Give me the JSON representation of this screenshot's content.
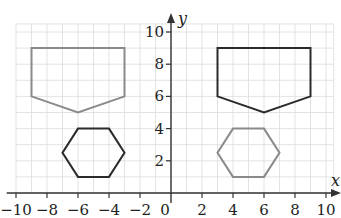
{
  "diagram": {
    "type": "coordinate-grid-transformation",
    "axes": {
      "x_label": "x",
      "y_label": "y",
      "x_range": [
        -10,
        10
      ],
      "y_range": [
        0,
        10
      ],
      "x_ticks": [
        -10,
        -8,
        -6,
        -4,
        -2,
        0,
        2,
        4,
        6,
        8,
        10
      ],
      "x_tick_labels": [
        "−10",
        "−8",
        "−6",
        "−4",
        "−2",
        "0",
        "2",
        "4",
        "6",
        "8",
        "10"
      ],
      "y_ticks": [
        2,
        4,
        6,
        8,
        10
      ],
      "y_tick_labels": [
        "2",
        "4",
        "6",
        "8",
        "10"
      ],
      "grid_step": 1
    },
    "shapes": [
      {
        "name": "pentagon-left",
        "kind": "pentagon",
        "stroke": "#8a8a8a",
        "points": [
          [
            -9,
            9
          ],
          [
            -3,
            9
          ],
          [
            -3,
            6
          ],
          [
            -6,
            5
          ],
          [
            -9,
            6
          ]
        ]
      },
      {
        "name": "pentagon-right",
        "kind": "pentagon",
        "stroke": "#2b2b2b",
        "points": [
          [
            3,
            9
          ],
          [
            9,
            9
          ],
          [
            9,
            6
          ],
          [
            6,
            5
          ],
          [
            3,
            6
          ]
        ]
      },
      {
        "name": "hexagon-left",
        "kind": "hexagon",
        "stroke": "#2b2b2b",
        "points": [
          [
            -6,
            4
          ],
          [
            -4,
            4
          ],
          [
            -3,
            2.5
          ],
          [
            -4,
            1
          ],
          [
            -6,
            1
          ],
          [
            -7,
            2.5
          ]
        ]
      },
      {
        "name": "hexagon-right",
        "kind": "hexagon",
        "stroke": "#8a8a8a",
        "points": [
          [
            4,
            4
          ],
          [
            6,
            4
          ],
          [
            7,
            2.5
          ],
          [
            6,
            1
          ],
          [
            4,
            1
          ],
          [
            3,
            2.5
          ]
        ]
      }
    ],
    "colors": {
      "grid": "#dcdcdc",
      "axis": "#333333",
      "light_shape": "#8a8a8a",
      "dark_shape": "#2b2b2b"
    }
  }
}
